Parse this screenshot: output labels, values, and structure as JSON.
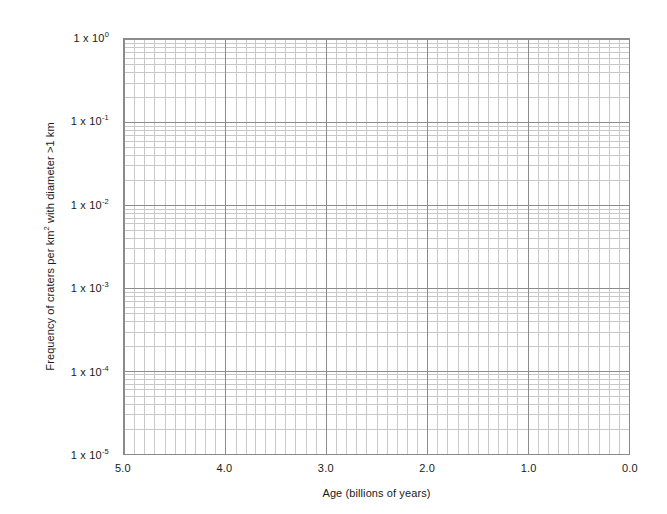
{
  "chart_data": {
    "type": "line",
    "title": "",
    "subtitle": "",
    "xlabel": "Age (billions of years)",
    "ylabel": "Frequency of craters per km2 with diameter >1 km",
    "ylabel_parts": {
      "before": "Frequency of craters per km",
      "sup": "2",
      "after": " with diameter >1 km"
    },
    "x_scale": "linear",
    "y_scale": "log",
    "x_reversed": true,
    "xlim": [
      5.0,
      0.0
    ],
    "ylim": [
      1e-05,
      1
    ],
    "grid": true,
    "grid_minor": true,
    "legend": "none",
    "series": [],
    "annotations": [],
    "x_ticks": [
      {
        "value": 5.0,
        "label": "5.0"
      },
      {
        "value": 4.0,
        "label": "4.0"
      },
      {
        "value": 3.0,
        "label": "3.0"
      },
      {
        "value": 2.0,
        "label": "2.0"
      },
      {
        "value": 1.0,
        "label": "1.0"
      },
      {
        "value": 0.0,
        "label": "0.0"
      }
    ],
    "x_minor_step": 0.1,
    "y_ticks": [
      {
        "value": 1,
        "exponent": "0",
        "mantissa": "1 x 10"
      },
      {
        "value": 0.1,
        "exponent": "-1",
        "mantissa": "1 x 10"
      },
      {
        "value": 0.01,
        "exponent": "-2",
        "mantissa": "1 x 10"
      },
      {
        "value": 0.001,
        "exponent": "-3",
        "mantissa": "1 x 10"
      },
      {
        "value": 0.0001,
        "exponent": "-4",
        "mantissa": "1 x 10"
      },
      {
        "value": 1e-05,
        "exponent": "-5",
        "mantissa": "1 x 10"
      }
    ],
    "y_minor_multipliers": [
      2,
      3,
      4,
      5,
      6,
      7,
      8,
      9
    ],
    "colors": {
      "background": "#ffffff",
      "frame": "#8a8a8a",
      "grid_major": "#8c8c8c",
      "grid_minor": "#c8c8c8",
      "text": "#1a1a1a"
    }
  }
}
